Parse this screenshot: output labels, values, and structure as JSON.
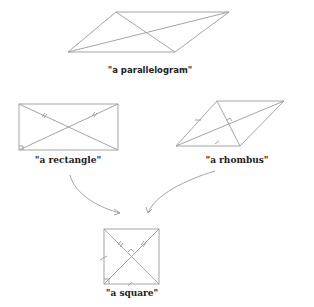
{
  "shapes": {
    "parallelogram": {
      "label": "\"a parallelogram\""
    },
    "rectangle": {
      "label": "\"a rectangle\""
    },
    "rhombus": {
      "label": "\"a rhombus\""
    },
    "square": {
      "label": "\"a square\""
    }
  },
  "colors": {
    "stroke": "#9a9a9a",
    "text": "#222222"
  }
}
